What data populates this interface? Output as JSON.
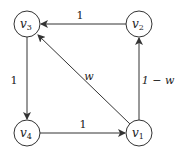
{
  "nodes": [
    {
      "id": "v1",
      "label": "v",
      "sub": "1",
      "x": 139,
      "y": 133
    },
    {
      "id": "v2",
      "label": "v",
      "sub": "2",
      "x": 139,
      "y": 24
    },
    {
      "id": "v3",
      "label": "v",
      "sub": "3",
      "x": 27,
      "y": 24
    },
    {
      "id": "v4",
      "label": "v",
      "sub": "4",
      "x": 27,
      "y": 133
    }
  ],
  "edges": [
    {
      "from": "v2",
      "to": "v3",
      "label": "1"
    },
    {
      "from": "v3",
      "to": "v4",
      "label": "1"
    },
    {
      "from": "v4",
      "to": "v1",
      "label": "1"
    },
    {
      "from": "v1",
      "to": "v2",
      "label": "1 − w"
    },
    {
      "from": "v1",
      "to": "v3",
      "label": "w"
    }
  ],
  "colors": {
    "stroke": "#333333",
    "background": "#ffffff"
  }
}
